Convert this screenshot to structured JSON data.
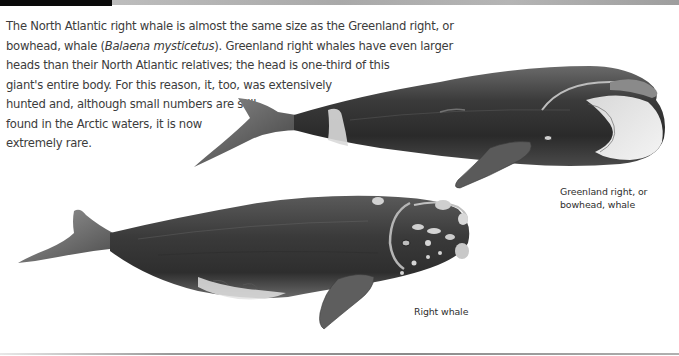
{
  "header": {
    "bar_colors": {
      "left": "#0a0a0a",
      "right": "#a9a9a9"
    }
  },
  "body": {
    "lines": [
      "The North Atlantic right whale is almost the same size as the Greenland right, or",
      "bowhead, whale (",
      "Balaena mysticetus",
      "). Greenland right whales have even larger",
      "heads than their North Atlantic relatives; the head is one-third of this",
      "giant's entire body. For this reason, it, too, was extensively",
      "hunted and, although small numbers are still",
      "found in the Arctic waters, it is now",
      "extremely rare."
    ]
  },
  "illustrations": [
    {
      "name": "Greenland right, or bowhead, whale",
      "label_lines": [
        "Greenland right, or",
        "bowhead, whale"
      ]
    },
    {
      "name": "Right whale",
      "label_lines": [
        "Right whale"
      ]
    }
  ],
  "footer": {
    "rule_color": "#8a8a8a"
  }
}
